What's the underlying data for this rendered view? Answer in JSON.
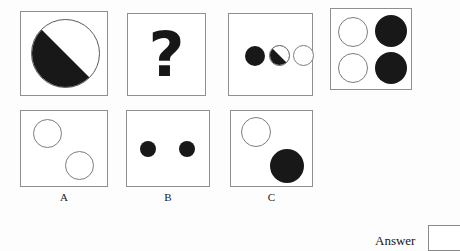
{
  "puzzle": {
    "type": "visual-analogy-matrix",
    "question_mark": "?",
    "sequence": [
      {
        "id": "panel-1",
        "name": "sequence-cell-1",
        "shapes": [
          {
            "kind": "circle-half-diagonal",
            "fill": "black-lower-left",
            "size": "large"
          }
        ]
      },
      {
        "id": "panel-2",
        "name": "sequence-cell-2-missing",
        "shapes": [
          {
            "kind": "question-mark",
            "glyph": "?"
          }
        ]
      },
      {
        "id": "panel-3",
        "name": "sequence-cell-3",
        "shapes": [
          {
            "kind": "circle-filled",
            "size": "small"
          },
          {
            "kind": "circle-half-diagonal",
            "fill": "black-lower-left",
            "size": "small"
          },
          {
            "kind": "circle-open",
            "size": "small"
          }
        ]
      },
      {
        "id": "panel-4",
        "name": "sequence-cell-4",
        "shapes": [
          {
            "kind": "circle-open",
            "size": "medium"
          },
          {
            "kind": "circle-filled",
            "size": "medium"
          },
          {
            "kind": "circle-open",
            "size": "medium"
          },
          {
            "kind": "circle-filled",
            "size": "medium"
          }
        ]
      }
    ],
    "options": [
      {
        "id": "panel-a",
        "label": "A",
        "shapes": [
          {
            "kind": "circle-open",
            "size": "medium"
          },
          {
            "kind": "circle-open",
            "size": "medium"
          }
        ]
      },
      {
        "id": "panel-b",
        "label": "B",
        "shapes": [
          {
            "kind": "circle-filled",
            "size": "small"
          },
          {
            "kind": "circle-filled",
            "size": "small"
          }
        ]
      },
      {
        "id": "panel-c",
        "label": "C",
        "shapes": [
          {
            "kind": "circle-open",
            "size": "medium"
          },
          {
            "kind": "circle-filled",
            "size": "large"
          }
        ]
      }
    ],
    "answer": {
      "label": "Answer",
      "value": "",
      "placeholder": ""
    },
    "colors": {
      "fill_black": "#181818",
      "outline_gray": "#7d7d7d",
      "panel_border": "#8f8f8f",
      "page_background": "#fdfdfd",
      "panel_background": "#ffffff",
      "text": "#151515"
    }
  }
}
